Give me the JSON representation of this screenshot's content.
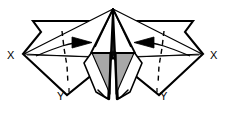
{
  "figure": {
    "kind": "origami-fold-diagram",
    "title": "",
    "background_color": "#ffffff",
    "stroke_color": "#000000",
    "shade_color": "#a8a8a8",
    "shade_color_dark": "#9a9a9a",
    "paper_color": "#ffffff"
  },
  "labels": {
    "x_left": "X",
    "x_right": "X",
    "y_left": "Y",
    "y_right": "Y"
  },
  "icons": {
    "arrow_left_flap": "arrow-right-icon",
    "arrow_right_flap": "arrow-left-icon",
    "fold_line_left": "dashed-fold-line-icon",
    "fold_line_right": "dashed-fold-line-icon"
  },
  "annotations": {
    "left_arrow_direction": "right",
    "right_arrow_direction": "left",
    "left_fold_line_style": "dashed",
    "right_fold_line_style": "dashed",
    "symmetry": "bilateral"
  },
  "shapes": {
    "outer_left_wing": "M 96,20 L 32,20 L 40,31 L 25,54 L 67,94 L 113,56 Z",
    "outer_right_wing": "M 130,20 L 194,20 L 186,31 L 201,54 L 159,94 L 113,56 Z",
    "left_upper_blade": "M 113,9 L 28,54 L 112,57 Z",
    "right_upper_blade": "M 113,9 L 198,54 L 114,57 Z",
    "center_left_panel": "M 113,9 L 88,56 L 108,98 L 111,57 Z",
    "center_right_panel": "M 113,9 L 138,56 L 118,98 L 115,57 Z",
    "shade_left": "M 92,54 L 110,54 L 110,92 Z",
    "shade_right": "M 134,54 L 116,54 L 116,92 Z"
  }
}
